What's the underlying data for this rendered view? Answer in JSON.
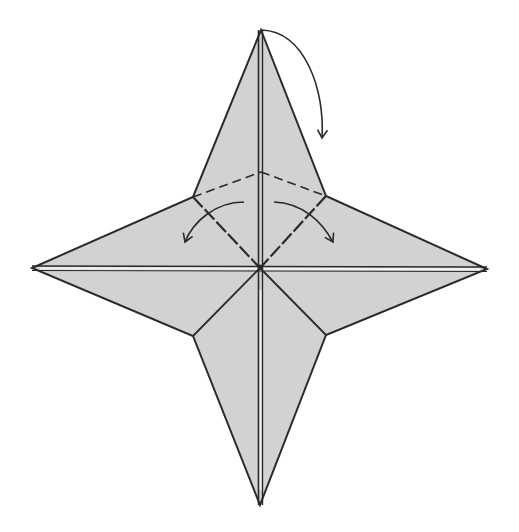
{
  "diagram": {
    "type": "origami-fold-diagram",
    "colors": {
      "background": "#ffffff",
      "paper_fill": "#d2d2d2",
      "line": "#2a2a2a",
      "crease_highlight": "#f2f2f2"
    },
    "center": [
      260,
      267
    ],
    "points": {
      "top": [
        261,
        30
      ],
      "bottom": [
        260,
        505
      ],
      "left": [
        32,
        268
      ],
      "right": [
        487,
        269
      ],
      "upper_left_notch": [
        193,
        197
      ],
      "upper_right_notch": [
        326,
        196
      ],
      "lower_left_notch": [
        193,
        336
      ],
      "lower_right_notch": [
        326,
        335
      ],
      "valley_apex": [
        261,
        172
      ]
    },
    "folds": [
      {
        "kind": "valley-fold-dashed",
        "from": "upper_left_notch",
        "to": "valley_apex"
      },
      {
        "kind": "valley-fold-dashed",
        "from": "valley_apex",
        "to": "upper_right_notch"
      },
      {
        "kind": "valley-fold-dashed",
        "from": "upper_left_notch",
        "to": "center"
      },
      {
        "kind": "valley-fold-dashed",
        "from": "upper_right_notch",
        "to": "center"
      }
    ],
    "arrows": [
      {
        "name": "fold-top-point-down",
        "direction": "clockwise-down"
      },
      {
        "name": "fold-left-flap-out",
        "direction": "down-left"
      },
      {
        "name": "fold-right-flap-out",
        "direction": "down-right"
      }
    ]
  }
}
